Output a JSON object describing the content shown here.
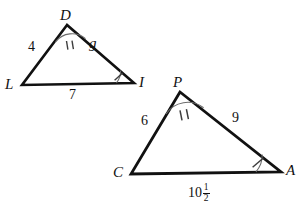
{
  "figure": {
    "type": "geometry-diagram",
    "stroke_color": "#111111",
    "mark_color": "#555555",
    "background": "#ffffff"
  },
  "triangle_1": {
    "name": "DLI",
    "vertices": [
      {
        "label": "D",
        "x": 67,
        "y": 25,
        "label_x": 60,
        "label_y": 11
      },
      {
        "label": "L",
        "x": 22,
        "y": 85,
        "label_x": 7,
        "label_y": 80
      },
      {
        "label": "I",
        "x": 134,
        "y": 83,
        "label_x": 139,
        "label_y": 79
      }
    ],
    "sides": [
      {
        "from": "D",
        "to": "L",
        "label": "4",
        "label_x": 31,
        "label_y": 45,
        "style": "plain"
      },
      {
        "from": "D",
        "to": "I",
        "label": "g",
        "label_x": 90,
        "label_y": 42,
        "style": "italic"
      },
      {
        "from": "L",
        "to": "I",
        "label": "7",
        "label_x": 71,
        "label_y": 89,
        "style": "plain"
      }
    ],
    "angle_marks": [
      {
        "at": "D",
        "ticks": 2
      },
      {
        "at": "I",
        "ticks": 1
      }
    ]
  },
  "triangle_2": {
    "name": "PCA",
    "vertices": [
      {
        "label": "P",
        "x": 180,
        "y": 92,
        "label_x": 173,
        "label_y": 78
      },
      {
        "label": "C",
        "x": 131,
        "y": 174,
        "label_x": 115,
        "label_y": 168
      },
      {
        "label": "A",
        "x": 281,
        "y": 172,
        "label_x": 286,
        "label_y": 166
      }
    ],
    "sides": [
      {
        "from": "P",
        "to": "C",
        "label": "6",
        "label_x": 143,
        "label_y": 120,
        "style": "plain"
      },
      {
        "from": "P",
        "to": "A",
        "label": "9",
        "label_x": 233,
        "label_y": 117,
        "style": "plain"
      },
      {
        "from": "C",
        "to": "A",
        "label": "10 1/2",
        "whole": "10",
        "numerator": "1",
        "denominator": "2",
        "label_x": 190,
        "label_y": 182,
        "style": "mixed-number"
      }
    ],
    "angle_marks": [
      {
        "at": "P",
        "ticks": 2
      },
      {
        "at": "A",
        "ticks": 1
      }
    ]
  }
}
